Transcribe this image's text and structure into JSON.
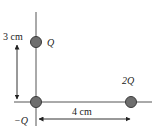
{
  "diagram": {
    "charges": [
      {
        "label": "Q",
        "cx": 36,
        "cy": 42
      },
      {
        "label": "−Q",
        "cx": 36,
        "cy": 102
      },
      {
        "label": "2Q",
        "cx": 131,
        "cy": 102
      }
    ],
    "dimensions": {
      "vertical": "3 cm",
      "horizontal": "4 cm"
    },
    "colors": {
      "charge_fill": "#6e6e6e",
      "charge_stroke": "#3a3a3a",
      "line": "#555555"
    }
  }
}
